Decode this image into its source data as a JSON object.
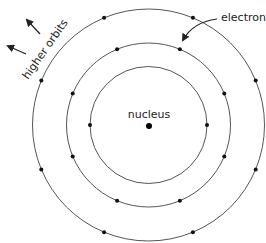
{
  "diagram": {
    "labels": {
      "nucleus": "nucleus",
      "electrons": "electrons",
      "higher_orbits": "higher orbits"
    },
    "orbits": [
      {
        "name": "inner",
        "electron_count": 2
      },
      {
        "name": "middle",
        "electron_count": 8
      },
      {
        "name": "outer",
        "electron_count": 8
      }
    ],
    "colors": {
      "orbit": "#555555",
      "electron": "#111111",
      "text": "#222222"
    }
  }
}
